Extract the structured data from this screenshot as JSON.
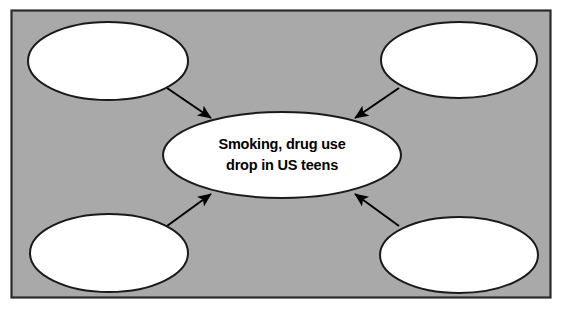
{
  "document": {
    "type": "concept-map-worksheet",
    "title": "Smoking, drug use drop in US teens",
    "panel": {
      "background_color": "#a9a9a9",
      "border_color": "#2b2b2b",
      "page_background_color": "#ffffff"
    }
  },
  "diagram": {
    "shape_fill_color": "#ffffff",
    "shape_stroke_color": "#1a1a1a",
    "arrow_color": "#000000",
    "center_node": {
      "id": "center",
      "name": "center-topic-ellipse",
      "text_lines": [
        "Smoking, drug use",
        "drop in US teens"
      ],
      "filled": true
    },
    "outer_nodes": [
      {
        "id": "top-left",
        "name": "detail-ellipse-top-left",
        "text_lines": [],
        "filled": false,
        "arrow_direction": "to-center"
      },
      {
        "id": "top-right",
        "name": "detail-ellipse-top-right",
        "text_lines": [],
        "filled": false,
        "arrow_direction": "to-center"
      },
      {
        "id": "bottom-left",
        "name": "detail-ellipse-bottom-left",
        "text_lines": [],
        "filled": false,
        "arrow_direction": "to-center"
      },
      {
        "id": "bottom-right",
        "name": "detail-ellipse-bottom-right",
        "text_lines": [],
        "filled": false,
        "arrow_direction": "to-center"
      }
    ]
  }
}
